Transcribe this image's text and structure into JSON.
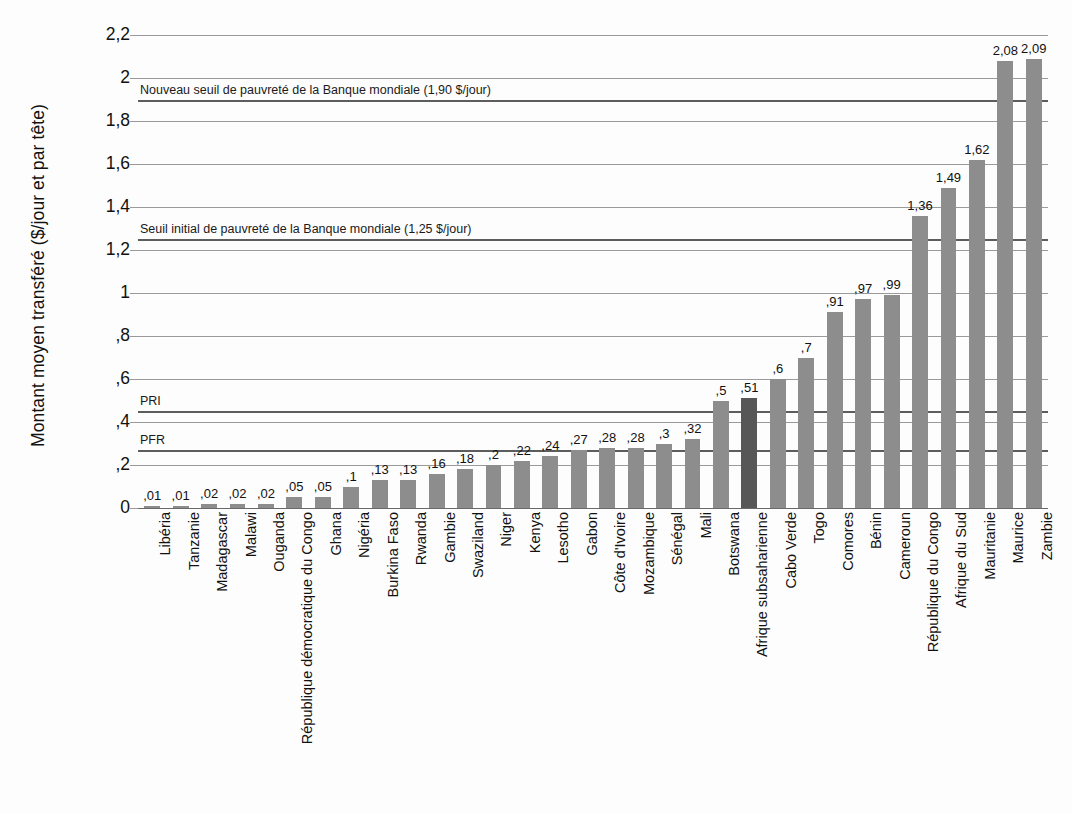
{
  "chart_data": {
    "type": "bar",
    "title": "",
    "subtitle": "",
    "xlabel": "",
    "ylabel": "Montant moyen transféré ($/jour et par tête)",
    "ylim": [
      0,
      2.2
    ],
    "grid": true,
    "legend": "none",
    "y_ticks": [
      0,
      0.2,
      0.4,
      0.6,
      0.8,
      1,
      1.2,
      1.4,
      1.6,
      1.8,
      2,
      2.2
    ],
    "y_tick_labels": [
      "0",
      ",2",
      ",4",
      ",6",
      ",8",
      "1",
      "1,2",
      "1,4",
      "1,6",
      "1,8",
      "2",
      "2,2"
    ],
    "categories": [
      "Libéria",
      "Tanzanie",
      "Madagascar",
      "Malawi",
      "Ouganda",
      "République démocratique du Congo",
      "Ghana",
      "Nigéria",
      "Burkina Faso",
      "Rwanda",
      "Gambie",
      "Swaziland",
      "Niger",
      "Kenya",
      "Lesotho",
      "Gabon",
      "Côte d'Ivoire",
      "Mozambique",
      "Sénégal",
      "Mali",
      "Botswana",
      "Afrique subsaharienne",
      "Cabo Verde",
      "Togo",
      "Comores",
      "Bénin",
      "Cameroun",
      "République du Congo",
      "Afrique du Sud",
      "Mauritanie",
      "Maurice",
      "Zambie"
    ],
    "values": [
      0.01,
      0.01,
      0.02,
      0.02,
      0.02,
      0.05,
      0.05,
      0.1,
      0.13,
      0.13,
      0.16,
      0.18,
      0.2,
      0.22,
      0.24,
      0.27,
      0.28,
      0.28,
      0.3,
      0.32,
      0.5,
      0.51,
      0.6,
      0.7,
      0.91,
      0.97,
      0.99,
      1.36,
      1.49,
      1.62,
      2.08,
      2.09
    ],
    "value_labels": [
      ",01",
      ",01",
      ",02",
      ",02",
      ",02",
      ",05",
      ",05",
      ",1",
      ",13",
      ",13",
      ",16",
      ",18",
      ",2",
      ",22",
      ",24",
      ",27",
      ",28",
      ",28",
      ",3",
      ",32",
      ",5",
      ",51",
      ",6",
      ",7",
      ",91",
      ",97",
      ",99",
      "1,36",
      "1,49",
      "1,62",
      "2,08",
      "2,09"
    ],
    "highlight_index": 21,
    "bar_color": "#8d8d8d",
    "highlight_color": "#575757",
    "reference_lines": [
      {
        "label": "Nouveau seuil de pauvreté de la Banque mondiale (1,90 $/jour)",
        "value": 1.9
      },
      {
        "label": "Seuil initial de pauvreté de la Banque mondiale (1,25 $/jour)",
        "value": 1.25
      },
      {
        "label": "PRI",
        "value": 0.45
      },
      {
        "label": "PFR",
        "value": 0.27
      }
    ]
  }
}
